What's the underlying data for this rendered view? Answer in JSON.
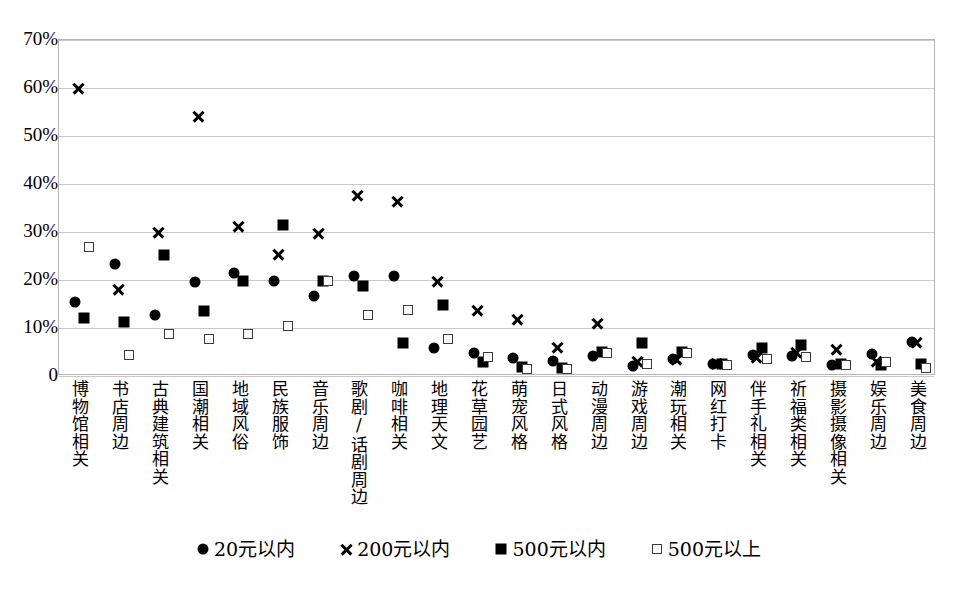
{
  "chart_data": {
    "type": "scatter",
    "title": "",
    "subtitle": "",
    "xlabel": "",
    "ylabel": "",
    "ylim": [
      0,
      0.7
    ],
    "ytick_labels": [
      "0",
      "10%",
      "20%",
      "30%",
      "40%",
      "50%",
      "60%",
      "70%"
    ],
    "ytick_values": [
      0,
      0.1,
      0.2,
      0.3,
      0.4,
      0.5,
      0.6,
      0.7
    ],
    "grid": true,
    "legend_position": "bottom",
    "categories": [
      "博物馆相关",
      "书店周边",
      "古典建筑相关",
      "国潮相关",
      "地域风俗",
      "民族服饰",
      "音乐周边",
      "歌剧/话剧周边",
      "咖啡相关",
      "地理天文",
      "花草园艺",
      "萌宠风格",
      "日式风格",
      "动漫周边",
      "游戏周边",
      "潮玩相关",
      "网红打卡",
      "伴手礼相关",
      "祈福类相关",
      "摄影摄像相关",
      "娱乐周边",
      "美食周边"
    ],
    "series": [
      {
        "name": "20元以内",
        "marker": "circle",
        "values": [
          0.155,
          0.233,
          0.128,
          0.195,
          0.214,
          0.197,
          0.167,
          0.208,
          0.208,
          0.058,
          0.048,
          0.037,
          0.031,
          0.042,
          0.02,
          0.035,
          0.026,
          0.043,
          0.042,
          0.022,
          0.045,
          0.071
        ]
      },
      {
        "name": "200元以内",
        "marker": "cross",
        "values": [
          0.6,
          0.181,
          0.3,
          0.54,
          0.311,
          0.254,
          0.296,
          0.377,
          0.364,
          0.196,
          0.136,
          0.118,
          0.059,
          0.11,
          0.031,
          0.035,
          0.027,
          0.038,
          0.049,
          0.055,
          0.03,
          0.069
        ]
      },
      {
        "name": "500元以内",
        "marker": "square",
        "values": [
          0.121,
          0.112,
          0.253,
          0.136,
          0.197,
          0.315,
          0.197,
          0.188,
          0.068,
          0.148,
          0.029,
          0.018,
          0.016,
          0.051,
          0.068,
          0.051,
          0.026,
          0.058,
          0.064,
          0.026,
          0.022,
          0.026
        ]
      },
      {
        "name": "500元以上",
        "marker": "open-square",
        "values": [
          0.269,
          0.043,
          0.088,
          0.077,
          0.088,
          0.105,
          0.197,
          0.127,
          0.138,
          0.078,
          0.039,
          0.014,
          0.014,
          0.047,
          0.026,
          0.048,
          0.023,
          0.035,
          0.04,
          0.023,
          0.029,
          0.017
        ]
      }
    ]
  },
  "legend": {
    "items": [
      {
        "label": "20元以内",
        "marker": "circle"
      },
      {
        "label": "200元以内",
        "marker": "cross"
      },
      {
        "label": "500元以内",
        "marker": "square"
      },
      {
        "label": "500元以上",
        "marker": "open-square"
      }
    ]
  },
  "caption": {
    "text": ""
  },
  "colors": {
    "marker": "#000000",
    "gridline": "#c8c8c8",
    "frame": "#b4b4b4",
    "background": "#ffffff"
  }
}
